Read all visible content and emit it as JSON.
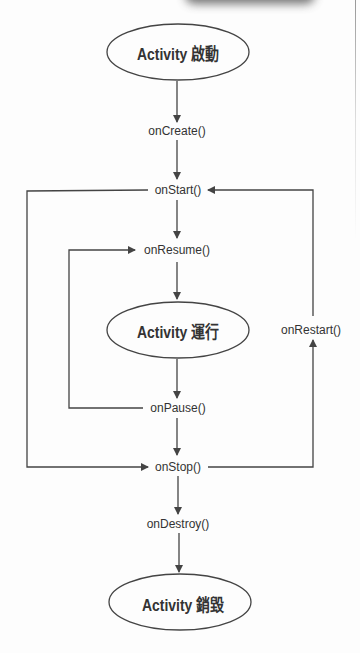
{
  "states": {
    "launch": "Activity 啟動",
    "running": "Activity 運行",
    "destroyed": "Activity 銷毀"
  },
  "callbacks": {
    "on_create": "onCreate()",
    "on_start": "onStart()",
    "on_resume": "onResume()",
    "on_pause": "onPause()",
    "on_stop": "onStop()",
    "on_destroy": "onDestroy()",
    "on_restart": "onRestart()"
  },
  "colors": {
    "line": "#444444",
    "text": "#333333",
    "background": "#fdfdfd"
  }
}
